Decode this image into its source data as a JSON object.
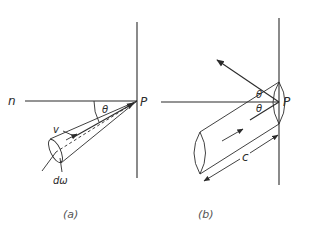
{
  "figure": {
    "panel_a": {
      "caption": "(a)",
      "labels": {
        "normal": "n",
        "angle": "θ",
        "point": "P",
        "velocity": "v",
        "solid_angle": "dω"
      }
    },
    "panel_b": {
      "caption": "(b)",
      "labels": {
        "angle_reflected": "θ",
        "angle_incident": "θ",
        "point": "P",
        "length": "c"
      }
    },
    "colors": {
      "ink": "#2b2b2b",
      "background": "#ffffff"
    }
  }
}
